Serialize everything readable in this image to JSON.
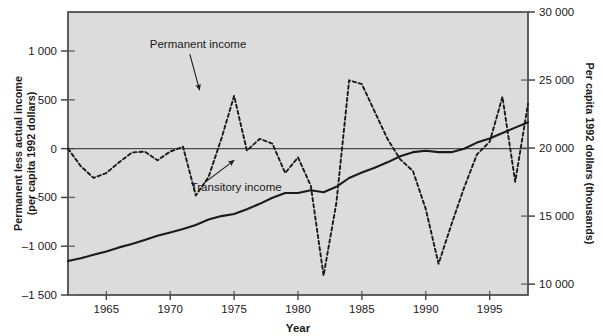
{
  "chart_data": {
    "type": "line",
    "title": "",
    "xlabel": "Year",
    "ylabel": "Permanent less actual income (per capita 1992 dollars)",
    "ylabel_right": "Per capita 1992 dollars (thousands)",
    "xlim": [
      1962,
      1998
    ],
    "ylim": [
      -1500,
      1400
    ],
    "ylim_right": [
      9200,
      30000
    ],
    "grid": false,
    "legend_position": "inline-annotations",
    "xticks": [
      1965,
      1970,
      1975,
      1980,
      1985,
      1990,
      1995
    ],
    "xtick_labels": [
      "1965",
      "1970",
      "1975",
      "1980",
      "1985",
      "1990",
      "1995"
    ],
    "yticks_left": [
      1000,
      500,
      0,
      -500,
      -1000,
      -1500
    ],
    "ytick_labels_left": [
      "1 000",
      "500",
      "0",
      "–500",
      "–1 000",
      "–1 500"
    ],
    "yticks_right": [
      30000,
      25000,
      20000,
      15000,
      10000
    ],
    "ytick_labels_right": [
      "30 000",
      "25 000",
      "20 000",
      "15 000",
      "10 000"
    ],
    "zero_line": 0,
    "annotations": [
      {
        "text": "Permanent income",
        "x": 1968.4,
        "y": 1030,
        "arrow_to_x": 1972.3,
        "arrow_to_y": 600
      },
      {
        "text": "Transitory income",
        "x": 1971.6,
        "y": -430,
        "arrow_to_x": 1975.0,
        "arrow_to_y": -120
      }
    ],
    "series": [
      {
        "name": "Permanent income",
        "style": "solid",
        "color": "#1a1a1a",
        "axis": "right",
        "x": [
          1962,
          1963,
          1964,
          1965,
          1966,
          1967,
          1968,
          1969,
          1970,
          1971,
          1972,
          1973,
          1974,
          1975,
          1976,
          1977,
          1978,
          1979,
          1980,
          1981,
          1982,
          1983,
          1984,
          1985,
          1986,
          1987,
          1988,
          1989,
          1990,
          1991,
          1992,
          1993,
          1994,
          1995,
          1996,
          1997,
          1998
        ],
        "values": [
          11700,
          11900,
          12150,
          12400,
          12700,
          12950,
          13250,
          13550,
          13800,
          14050,
          14350,
          14750,
          15000,
          15150,
          15500,
          15900,
          16350,
          16700,
          16700,
          16900,
          16750,
          17150,
          17800,
          18200,
          18550,
          18950,
          19400,
          19700,
          19800,
          19700,
          19700,
          19950,
          20400,
          20700,
          21100,
          21500,
          21900
        ]
      },
      {
        "name": "Transitory income",
        "style": "dashed",
        "color": "#1a1a1a",
        "axis": "left",
        "x": [
          1962,
          1963,
          1964,
          1965,
          1966,
          1967,
          1968,
          1969,
          1970,
          1971,
          1972,
          1973,
          1974,
          1975,
          1976,
          1977,
          1978,
          1979,
          1980,
          1981,
          1982,
          1983,
          1984,
          1985,
          1986,
          1987,
          1988,
          1989,
          1990,
          1991,
          1992,
          1993,
          1994,
          1995,
          1996,
          1997,
          1998
        ],
        "values": [
          0,
          -180,
          -300,
          -250,
          -140,
          -40,
          -30,
          -120,
          -30,
          20,
          -480,
          -290,
          100,
          540,
          -20,
          100,
          50,
          -250,
          -90,
          -380,
          -1300,
          -560,
          700,
          660,
          380,
          100,
          -110,
          -230,
          -620,
          -1180,
          -780,
          -400,
          -60,
          70,
          530,
          -340,
          460
        ]
      }
    ]
  },
  "axes": {
    "left_title_line1": "Permanent less actual income",
    "left_title_line2": "(per capita 1992 dollars)",
    "right_title": "Per capita 1992 dollars (thousands)",
    "x_title": "Year"
  },
  "colors": {
    "plot_background": "#dcdcdc",
    "plot_border": "#3a3a3a",
    "line": "#1a1a1a",
    "text": "#1a1a1a",
    "page_background": "#ffffff"
  }
}
